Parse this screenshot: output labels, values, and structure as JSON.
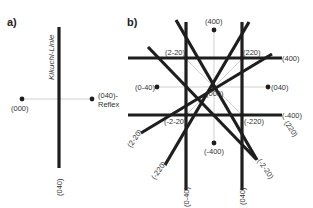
{
  "panel_a": {
    "label": "a)",
    "kikuchi_line_label": "Kikuchi-Linie",
    "line_bottom_label": "(040)",
    "origin_label": "(000)",
    "reflex_label_1": "(040)-",
    "reflex_label_2": "Reflex"
  },
  "panel_b": {
    "label": "b)",
    "spots": {
      "top": "(400)",
      "center": "(000)",
      "left": "(0-40)",
      "right": "(040)",
      "bottom": "(-400)"
    },
    "intersections": {
      "upper_left": "(2-20)",
      "upper_right": "(220)",
      "lower_left": "(-2-20)",
      "lower_right": "(-220)"
    },
    "line_ends": {
      "upper_horizontal_right": "(400)",
      "lower_horizontal_right": "(-400)",
      "left_vertical_bottom": "(0-40)",
      "right_vertical_bottom": "(040)",
      "diag_lower_left_1": "(2-20)",
      "diag_lower_left_2": "(-220)",
      "diag_lower_right_1": "(220)",
      "diag_lower_right_2": "(-2-20)"
    }
  }
}
